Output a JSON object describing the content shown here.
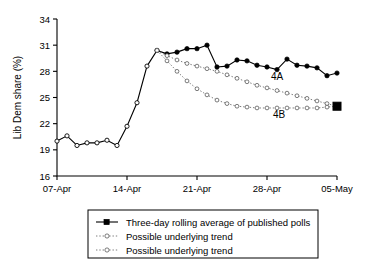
{
  "chart_data": {
    "type": "line",
    "title": "",
    "xlabel": "",
    "ylabel": "Lib Dem share (%)",
    "ylim": [
      16,
      34
    ],
    "yticks": [
      16,
      19,
      22,
      25,
      28,
      31,
      34
    ],
    "xticks": [
      "07-Apr",
      "14-Apr",
      "21-Apr",
      "28-Apr",
      "05-May"
    ],
    "xlim_days": [
      0,
      28
    ],
    "grid": false,
    "legend_position": "below-plot",
    "annotations": [
      {
        "text": "4A",
        "x_day": 22.0,
        "y": 27.0
      },
      {
        "text": "4B",
        "x_day": 22.2,
        "y": 22.6
      }
    ],
    "series": [
      {
        "name": "Three-day rolling average of published polls",
        "style": "solid",
        "marker": "filled-circle",
        "x": [
          0,
          1,
          2,
          3,
          4,
          5,
          6,
          7,
          8,
          9,
          10,
          11,
          12,
          13,
          14,
          15,
          16,
          17,
          18,
          19,
          20,
          21,
          22,
          23,
          24,
          25,
          26,
          27,
          28
        ],
        "values": [
          20.0,
          20.6,
          19.5,
          19.8,
          19.8,
          20.1,
          19.5,
          21.7,
          24.4,
          28.6,
          30.4,
          30.0,
          30.2,
          30.6,
          30.6,
          31.0,
          28.5,
          28.6,
          29.3,
          29.2,
          28.7,
          28.5,
          28.2,
          29.4,
          28.7,
          28.6,
          28.4,
          27.5,
          27.8
        ]
      },
      {
        "name": "Possible underlying trend",
        "label": "4A",
        "style": "dotted",
        "marker": "open-circle",
        "x": [
          10,
          11,
          12,
          13,
          14,
          15,
          16,
          17,
          18,
          19,
          20,
          21,
          22,
          23,
          24,
          25,
          26,
          27,
          28
        ],
        "values": [
          30.4,
          29.8,
          29.3,
          28.9,
          28.6,
          28.3,
          28.0,
          27.6,
          27.2,
          26.8,
          26.4,
          26.1,
          25.8,
          25.5,
          25.2,
          24.9,
          24.6,
          24.3,
          24.0
        ]
      },
      {
        "name": "Possible underlying trend",
        "label": "4B",
        "style": "dotted",
        "marker": "open-circle",
        "x": [
          10,
          11,
          12,
          13,
          14,
          15,
          16,
          17,
          18,
          19,
          20,
          21,
          22,
          23,
          24,
          25,
          26,
          27,
          28
        ],
        "values": [
          30.4,
          29.2,
          28.0,
          26.9,
          26.0,
          25.3,
          24.7,
          24.3,
          24.0,
          23.9,
          23.8,
          23.8,
          23.8,
          23.8,
          23.8,
          23.8,
          23.8,
          23.9,
          24.0
        ]
      }
    ],
    "endpoint_marker": {
      "x_day": 28,
      "y": 24.0,
      "shape": "filled-square"
    }
  },
  "legend": {
    "items": [
      {
        "label": "Three-day rolling average of published polls",
        "style": "solid-filled-square"
      },
      {
        "label": "Possible underlying trend",
        "style": "dotted-open-circle"
      },
      {
        "label": "Possible underlying trend",
        "style": "dotted-open-circle"
      }
    ]
  }
}
